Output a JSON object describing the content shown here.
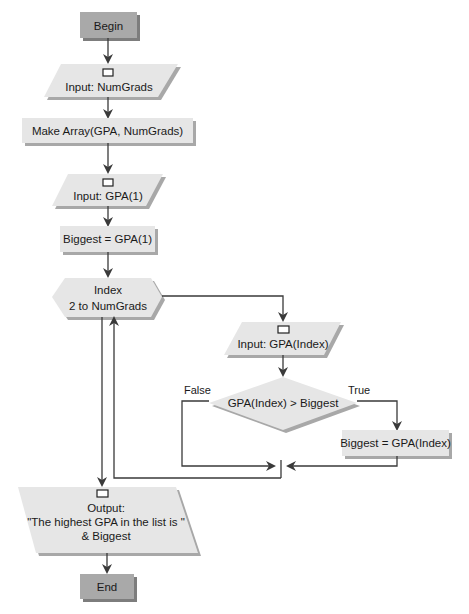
{
  "diagram": {
    "type": "flowchart",
    "nodes": {
      "begin": {
        "shape": "terminal",
        "label": "Begin"
      },
      "input_numgrads": {
        "shape": "input",
        "label": "Input: NumGrads"
      },
      "make_array": {
        "shape": "process",
        "label": "Make Array(GPA, NumGrads)"
      },
      "input_gpa1": {
        "shape": "input",
        "label": "Input: GPA(1)"
      },
      "biggest_init": {
        "shape": "process",
        "label": "Biggest = GPA(1)"
      },
      "loop": {
        "shape": "loop",
        "line1": "Index",
        "line2": "2 to NumGrads"
      },
      "input_gpa_index": {
        "shape": "input",
        "label": "Input: GPA(Index)"
      },
      "decision": {
        "shape": "decision",
        "label": "GPA(Index) > Biggest"
      },
      "biggest_update": {
        "shape": "process",
        "label": "Biggest = GPA(Index)"
      },
      "output": {
        "shape": "output",
        "line1": "Output:",
        "line2": "\"The highest GPA in the list is \"",
        "line3": "& Biggest"
      },
      "end": {
        "shape": "terminal",
        "label": "End"
      }
    },
    "edge_labels": {
      "false": "False",
      "true": "True"
    },
    "edges": [
      [
        "begin",
        "input_numgrads"
      ],
      [
        "input_numgrads",
        "make_array"
      ],
      [
        "make_array",
        "input_gpa1"
      ],
      [
        "input_gpa1",
        "biggest_init"
      ],
      [
        "biggest_init",
        "loop"
      ],
      [
        "loop",
        "input_gpa_index"
      ],
      [
        "input_gpa_index",
        "decision"
      ],
      [
        "decision",
        "biggest_update",
        "True"
      ],
      [
        "decision",
        "merge",
        "False"
      ],
      [
        "biggest_update",
        "merge"
      ],
      [
        "merge",
        "loop"
      ],
      [
        "loop",
        "output"
      ],
      [
        "output",
        "end"
      ]
    ],
    "colors": {
      "shape_fill": "#e6e6e6",
      "terminal_fill": "#a9a9a9",
      "shadow": "#a8a8a8",
      "line": "#3a3a3a"
    }
  }
}
